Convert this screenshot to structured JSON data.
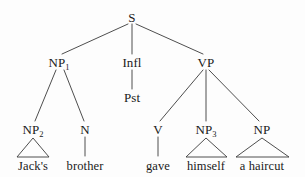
{
  "figure": {
    "kind": "syntax-tree",
    "sentence": "Jack's brother gave himself a haircut",
    "background_color": "#fdfdfd",
    "line_color": "#3a3a3a",
    "text_color": "#1a1a1a"
  },
  "nodes": {
    "s": {
      "label": "S",
      "x": 132,
      "y": 17
    },
    "np1": {
      "label": "NP",
      "sub": "1",
      "x": 59,
      "y": 62
    },
    "infl": {
      "label": "Infl",
      "x": 132,
      "y": 62
    },
    "vp": {
      "label": "VP",
      "x": 206,
      "y": 62
    },
    "pst": {
      "label": "Pst",
      "x": 132,
      "y": 97
    },
    "np2": {
      "label": "NP",
      "sub": "2",
      "x": 33,
      "y": 129
    },
    "n": {
      "label": "N",
      "x": 85,
      "y": 129
    },
    "v": {
      "label": "V",
      "x": 158,
      "y": 129
    },
    "np3": {
      "label": "NP",
      "sub": "3",
      "x": 206,
      "y": 129
    },
    "np4": {
      "label": "NP",
      "x": 262,
      "y": 129
    }
  },
  "terminals": {
    "jacks": {
      "label": "Jack's",
      "x": 33,
      "y": 166
    },
    "brother": {
      "label": "brother",
      "x": 85,
      "y": 166
    },
    "gave": {
      "label": "gave",
      "x": 158,
      "y": 166
    },
    "himself": {
      "label": "himself",
      "x": 206,
      "y": 166
    },
    "a_haircut": {
      "label": "a haircut",
      "x": 262,
      "y": 166
    }
  },
  "edges": [
    {
      "name": "s-to-np1",
      "x1": 128,
      "y1": 24,
      "x2": 62,
      "y2": 54
    },
    {
      "name": "s-to-infl",
      "x1": 132,
      "y1": 24,
      "x2": 132,
      "y2": 54
    },
    {
      "name": "s-to-vp",
      "x1": 136,
      "y1": 24,
      "x2": 203,
      "y2": 54
    },
    {
      "name": "np1-to-np2",
      "x1": 56,
      "y1": 70,
      "x2": 35,
      "y2": 121
    },
    {
      "name": "np1-to-n",
      "x1": 64,
      "y1": 70,
      "x2": 84,
      "y2": 121
    },
    {
      "name": "infl-to-pst",
      "x1": 132,
      "y1": 70,
      "x2": 132,
      "y2": 89
    },
    {
      "name": "vp-to-v",
      "x1": 203,
      "y1": 70,
      "x2": 160,
      "y2": 121
    },
    {
      "name": "vp-to-np3",
      "x1": 206,
      "y1": 70,
      "x2": 206,
      "y2": 121
    },
    {
      "name": "vp-to-np4",
      "x1": 209,
      "y1": 70,
      "x2": 259,
      "y2": 121
    },
    {
      "name": "n-to-brother",
      "x1": 85,
      "y1": 137,
      "x2": 85,
      "y2": 156
    },
    {
      "name": "v-to-gave",
      "x1": 158,
      "y1": 137,
      "x2": 158,
      "y2": 156
    }
  ],
  "triangles": [
    {
      "name": "np2-triangle",
      "apex_x": 33,
      "apex_y": 138,
      "left_x": 17,
      "right_x": 49,
      "base_y": 157
    },
    {
      "name": "np3-triangle",
      "apex_x": 206,
      "apex_y": 138,
      "left_x": 186,
      "right_x": 227,
      "base_y": 157
    },
    {
      "name": "np4-triangle",
      "apex_x": 262,
      "apex_y": 138,
      "left_x": 236,
      "right_x": 289,
      "base_y": 157
    }
  ]
}
